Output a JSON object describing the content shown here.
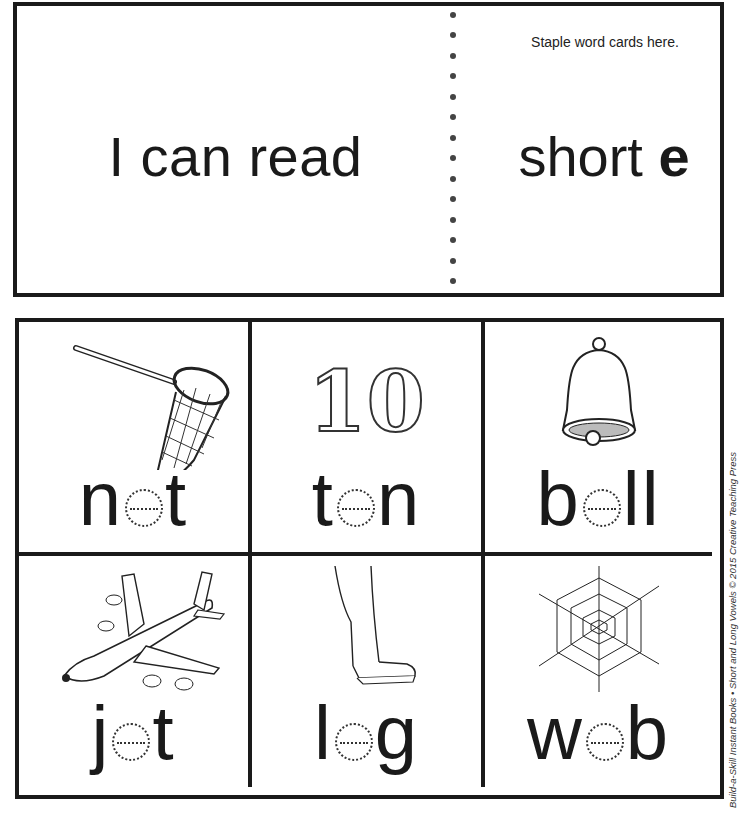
{
  "header": {
    "title_left": "I can read",
    "title_right_prefix": "short ",
    "title_right_vowel": "e",
    "staple_note": "Staple word cards here."
  },
  "cards": [
    {
      "picture": "butterfly-net",
      "word": {
        "before": "n",
        "vowel": "e",
        "after": "t",
        "full": "net"
      }
    },
    {
      "picture": "number-ten",
      "picture_text": "10",
      "word": {
        "before": "t",
        "vowel": "e",
        "after": "n",
        "full": "ten"
      }
    },
    {
      "picture": "bell",
      "word": {
        "before": "b",
        "vowel": "e",
        "after": "ll",
        "full": "bell"
      }
    },
    {
      "picture": "jet-airplane",
      "word": {
        "before": "j",
        "vowel": "e",
        "after": "t",
        "full": "jet"
      }
    },
    {
      "picture": "leg-with-shoe",
      "word": {
        "before": "l",
        "vowel": "e",
        "after": "g",
        "full": "leg"
      }
    },
    {
      "picture": "spider-web",
      "word": {
        "before": "w",
        "vowel": "e",
        "after": "b",
        "full": "web"
      }
    }
  ],
  "credit": "Build-a-Skill Instant Books • Short and Long Vowels © 2015 Creative Teaching Press",
  "colors": {
    "ink": "#1a1a1a",
    "background": "#ffffff"
  }
}
